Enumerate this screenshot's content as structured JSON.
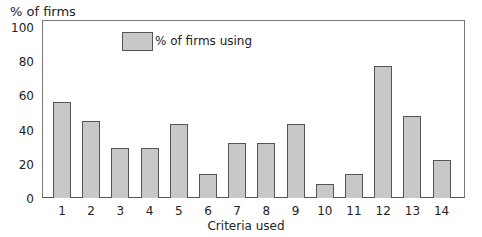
{
  "chart_data": {
    "type": "bar",
    "title": "",
    "xlabel": "Criteria used",
    "ylabel": "% of firms",
    "ylim": [
      0,
      100
    ],
    "yticks": [
      0,
      20,
      40,
      60,
      80,
      100
    ],
    "grid": false,
    "legend": {
      "position": "top-left-inside",
      "entries": [
        "% of firms using"
      ]
    },
    "categories": [
      "1",
      "2",
      "3",
      "4",
      "5",
      "6",
      "7",
      "8",
      "9",
      "10",
      "11",
      "12",
      "13",
      "14"
    ],
    "series": [
      {
        "name": "% of firms using",
        "color": "#c8c8c8",
        "values": [
          56,
          45,
          29,
          29,
          43,
          14,
          32,
          32,
          43,
          8,
          14,
          77,
          48,
          22
        ]
      }
    ]
  },
  "labels": {
    "ylabel": "% of firms",
    "xlabel": "Criteria used",
    "legend": "% of firms using"
  }
}
